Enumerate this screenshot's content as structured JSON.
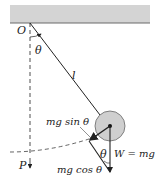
{
  "diagram": {
    "labels": {
      "pivot": "O",
      "angle_top": "θ",
      "length": "l",
      "tangential_force": "mg sin θ",
      "angle_bottom": "θ",
      "weight": "W = mg",
      "radial_force": "mg cos θ",
      "lowest_point": "P"
    },
    "colors": {
      "ceiling": "#d4d4d4",
      "ceiling_edge": "#6a6a6a",
      "bob_fill": "#cfcfcf",
      "line": "#222222"
    }
  }
}
